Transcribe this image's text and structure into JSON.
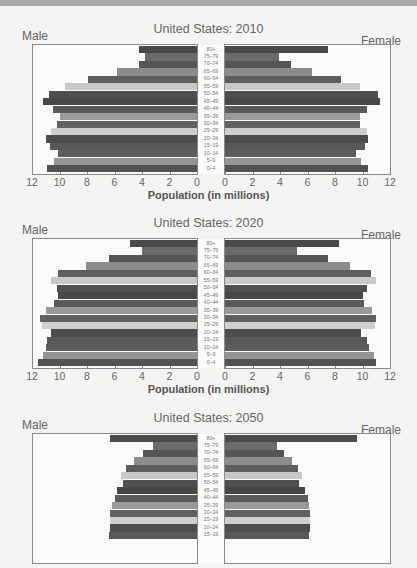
{
  "chart_data": [
    {
      "type": "bar",
      "subtype": "population-pyramid",
      "title": "United States: 2010",
      "left_label": "Male",
      "right_label": "Female",
      "xlabel": "Population (in millions)",
      "xlim": [
        0,
        12
      ],
      "x_ticks": [
        12,
        10,
        8,
        6,
        4,
        2,
        0,
        0,
        2,
        4,
        6,
        8,
        10,
        12
      ],
      "categories": [
        "80+",
        "75–79",
        "70–74",
        "65–69",
        "60–64",
        "55–59",
        "50–54",
        "45–49",
        "40–44",
        "35–39",
        "30–34",
        "25–29",
        "20–24",
        "15–19",
        "10–14",
        "5–9",
        "0–4"
      ],
      "series": [
        {
          "name": "Male",
          "values": [
            4.2,
            3.8,
            4.2,
            5.8,
            7.9,
            9.6,
            10.8,
            11.2,
            10.5,
            10.0,
            10.2,
            10.6,
            11.0,
            10.7,
            10.1,
            10.4,
            10.9
          ]
        },
        {
          "name": "Female",
          "values": [
            7.5,
            3.9,
            4.8,
            6.3,
            8.4,
            9.8,
            11.1,
            11.3,
            10.3,
            9.8,
            9.8,
            10.3,
            10.4,
            10.2,
            9.5,
            9.9,
            10.4
          ]
        }
      ]
    },
    {
      "type": "bar",
      "subtype": "population-pyramid",
      "title": "United States: 2020",
      "left_label": "Male",
      "right_label": "Female",
      "xlabel": "Population (in millions)",
      "xlim": [
        0,
        12
      ],
      "x_ticks": [
        12,
        10,
        8,
        6,
        4,
        2,
        0,
        0,
        2,
        4,
        6,
        8,
        10,
        12
      ],
      "categories": [
        "80+",
        "75–79",
        "70–74",
        "65–69",
        "60–64",
        "55–59",
        "50–54",
        "45–49",
        "40–44",
        "35–39",
        "30–34",
        "25–29",
        "20–24",
        "15–19",
        "10–14",
        "5–9",
        "0–4"
      ],
      "series": [
        {
          "name": "Male",
          "values": [
            4.9,
            4.0,
            6.4,
            8.1,
            10.1,
            10.6,
            10.2,
            10.1,
            10.4,
            11.0,
            11.4,
            11.3,
            10.6,
            10.9,
            11.0,
            11.2,
            11.6
          ]
        },
        {
          "name": "Female",
          "values": [
            8.3,
            5.2,
            7.5,
            9.1,
            10.6,
            11.0,
            10.3,
            10.0,
            10.1,
            10.7,
            11.0,
            10.9,
            9.9,
            10.3,
            10.5,
            10.8,
            11.0
          ]
        }
      ]
    },
    {
      "type": "bar",
      "subtype": "population-pyramid",
      "title": "United States: 2050",
      "left_label": "Male",
      "right_label": "Female",
      "note": "Chart truncated at bottom; only rows 80+ through 15–19 visible",
      "categories": [
        "80+",
        "75–79",
        "70–74",
        "65–69",
        "60–64",
        "55–59",
        "50–54",
        "45–49",
        "40–44",
        "35–39",
        "30–34",
        "25–29",
        "20–24",
        "15–19"
      ],
      "series": [
        {
          "name": "Male",
          "values": [
            6.3,
            3.2,
            3.9,
            4.6,
            5.2,
            5.5,
            5.4,
            5.8,
            6.0,
            6.2,
            6.3,
            6.3,
            6.3,
            6.4
          ]
        },
        {
          "name": "Female",
          "values": [
            9.6,
            3.8,
            4.3,
            4.9,
            5.3,
            5.6,
            5.4,
            5.8,
            6.0,
            6.1,
            6.2,
            6.2,
            6.2,
            6.1
          ]
        }
      ]
    }
  ],
  "layout": {
    "pyramids_top": [
      22,
      216,
      411
    ],
    "visible_rows": [
      17,
      17,
      14
    ],
    "show_axis": [
      true,
      true,
      false
    ]
  },
  "colors": {
    "bar_palette": [
      "#4a4a4a",
      "#6b6b6b",
      "#555555",
      "#8c8c8c",
      "#5e5e5e",
      "#c8c8c6",
      "#4f4f4f",
      "#474747",
      "#5a5a5a",
      "#9a9a9a",
      "#606060",
      "#cfcfcd",
      "#4d4d4d",
      "#585858",
      "#5c5c5c",
      "#959595",
      "#525252"
    ]
  }
}
